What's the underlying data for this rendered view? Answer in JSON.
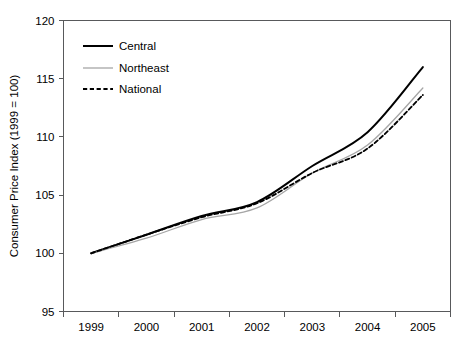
{
  "chart_data": {
    "type": "line",
    "title": "",
    "xlabel": "",
    "ylabel": "Consumer Price Index (1999 = 100)",
    "x": [
      1999,
      2000,
      2001,
      2002,
      2003,
      2004,
      2005
    ],
    "xtick_labels": [
      "1999",
      "2000",
      "2001",
      "2002",
      "2003",
      "2004",
      "2005"
    ],
    "ytick_labels": [
      "95",
      "100",
      "105",
      "110",
      "115",
      "120"
    ],
    "ytick_values": [
      95,
      100,
      105,
      110,
      115,
      120
    ],
    "xlim": [
      1999,
      2005
    ],
    "ylim": [
      95,
      120
    ],
    "grid": false,
    "legend_position": "upper-left-inside",
    "series": [
      {
        "name": "Central",
        "color": "#000000",
        "style": "solid",
        "width": 2.0,
        "values": [
          100.0,
          101.6,
          103.2,
          104.4,
          107.5,
          110.4,
          116.0
        ]
      },
      {
        "name": "Northeast",
        "color": "#a6a6a6",
        "style": "solid",
        "width": 1.3,
        "values": [
          100.0,
          101.3,
          102.9,
          103.9,
          106.9,
          109.3,
          114.2
        ]
      },
      {
        "name": "National",
        "color": "#000000",
        "style": "dashed",
        "width": 1.8,
        "values": [
          100.0,
          101.6,
          103.1,
          104.3,
          106.9,
          109.0,
          113.6
        ]
      }
    ]
  },
  "legend": {
    "items": [
      {
        "label": "Central"
      },
      {
        "label": "Northeast"
      },
      {
        "label": "National"
      }
    ]
  },
  "axes": {
    "y_title": "Consumer Price Index (1999 = 100)",
    "y_ticks": [
      "120",
      "115",
      "110",
      "105",
      "100",
      "95"
    ],
    "x_ticks": [
      "1999",
      "2000",
      "2001",
      "2002",
      "2003",
      "2004",
      "2005"
    ]
  }
}
